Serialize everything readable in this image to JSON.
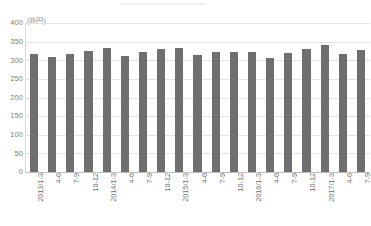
{
  "chart_data": {
    "type": "bar",
    "title": "",
    "subtitle": "",
    "xlabel": "",
    "ylabel": "",
    "unit_label": "(兆円)",
    "ylim": [
      0,
      400
    ],
    "ytick_step": 50,
    "yticks": [
      "400",
      "350",
      "300",
      "250",
      "200",
      "150",
      "100",
      "50",
      "0"
    ],
    "grid": true,
    "legend": null,
    "legend_position": "none",
    "series_color": "#6f6f6f",
    "categories": [
      "2013/1-3",
      "4-6",
      "7-9",
      "10-12",
      "2014/1-3",
      "4-6",
      "7-9",
      "10-12",
      "2015/1-3",
      "4-6",
      "7-9",
      "10-12",
      "2016/1-3",
      "4-6",
      "7-9",
      "10-12",
      "2017/1-3",
      "4-6",
      "7-9"
    ],
    "values": [
      318,
      310,
      317,
      325,
      333,
      312,
      322,
      330,
      334,
      314,
      322,
      321,
      321,
      305,
      320,
      330,
      340,
      317,
      328
    ]
  },
  "footer": {
    "note": ""
  }
}
